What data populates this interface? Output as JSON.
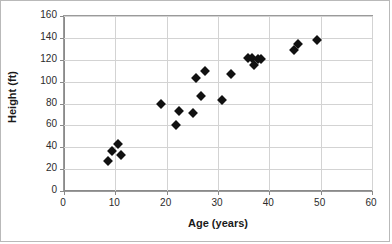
{
  "chart_data": {
    "type": "scatter",
    "title": "",
    "xlabel": "Age (years)",
    "ylabel": "Height (ft)",
    "xlim": [
      0,
      60
    ],
    "ylim": [
      0,
      160
    ],
    "xticks": [
      0,
      10,
      20,
      30,
      40,
      50,
      60
    ],
    "yticks": [
      0,
      20,
      40,
      60,
      80,
      100,
      120,
      140,
      160
    ],
    "grid": true,
    "legend": false,
    "marker": "diamond",
    "marker_color": "#111111",
    "points": [
      {
        "x": 8.6,
        "y": 27
      },
      {
        "x": 9.4,
        "y": 37
      },
      {
        "x": 10.6,
        "y": 43
      },
      {
        "x": 11.2,
        "y": 33
      },
      {
        "x": 18.8,
        "y": 80
      },
      {
        "x": 21.9,
        "y": 60
      },
      {
        "x": 22.4,
        "y": 73
      },
      {
        "x": 25.1,
        "y": 71
      },
      {
        "x": 25.8,
        "y": 103
      },
      {
        "x": 26.6,
        "y": 87
      },
      {
        "x": 27.4,
        "y": 110
      },
      {
        "x": 30.8,
        "y": 83
      },
      {
        "x": 32.6,
        "y": 107
      },
      {
        "x": 35.8,
        "y": 122
      },
      {
        "x": 36.7,
        "y": 122
      },
      {
        "x": 37.1,
        "y": 115
      },
      {
        "x": 37.7,
        "y": 121
      },
      {
        "x": 38.4,
        "y": 121
      },
      {
        "x": 44.9,
        "y": 129
      },
      {
        "x": 45.6,
        "y": 134
      },
      {
        "x": 49.2,
        "y": 138
      }
    ]
  }
}
